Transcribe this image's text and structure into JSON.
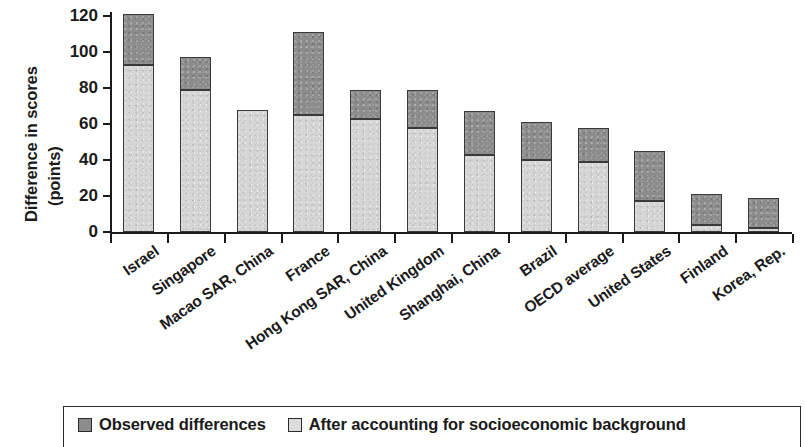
{
  "chart_data": {
    "type": "bar",
    "subtype": "stacked-overlay",
    "title": "",
    "xlabel": "",
    "ylabel": "Difference in scores (points)",
    "ylabel_lines": [
      "Difference in scores",
      "(points)"
    ],
    "ylim": [
      0,
      120
    ],
    "ytick_values": [
      0,
      20,
      40,
      60,
      80,
      100,
      120
    ],
    "ytick_labels": [
      "0",
      "20",
      "40",
      "60",
      "80",
      "100",
      "120"
    ],
    "grid": false,
    "legend_position": "bottom",
    "categories": [
      "Israel",
      "Singapore",
      "Macao SAR, China",
      "France",
      "Hong Kong SAR, China",
      "United Kingdom",
      "Shanghai, China",
      "Brazil",
      "OECD average",
      "United States",
      "Finland",
      "Korea, Rep."
    ],
    "series": [
      {
        "name": "Observed differences",
        "color": "#8c8c8c",
        "values": [
          121,
          97,
          68,
          111,
          79,
          79,
          67,
          61,
          58,
          45,
          21,
          19
        ]
      },
      {
        "name": "After accounting for socioeconomic background",
        "color": "#d6d6d6",
        "values": [
          93,
          79,
          68,
          65,
          63,
          58,
          43,
          40,
          39,
          17,
          4,
          2
        ]
      }
    ]
  },
  "legend": {
    "items": [
      {
        "label": "Observed differences",
        "swatch": "dark-gray-square"
      },
      {
        "label": "After accounting for socioeconomic background",
        "swatch": "light-gray-square"
      }
    ]
  }
}
